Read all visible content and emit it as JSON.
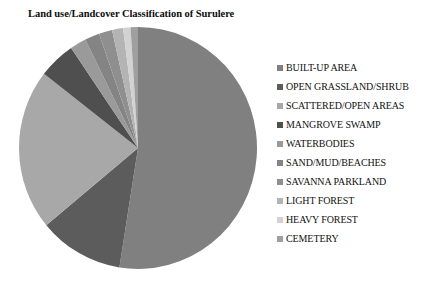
{
  "chart_data": {
    "type": "pie",
    "title": "Land use/Landcover Classification of Surulere",
    "xlabel": "",
    "ylabel": "",
    "legend_position": "right",
    "grid": false,
    "categories": [
      "BUILT-UP AREA",
      "OPEN GRASSLAND/SHRUB",
      "SCATTERED/OPEN AREAS",
      "MANGROVE SWAMP",
      "WATERBODIES",
      "SAND/MUD/BEACHES",
      "SAVANNA PARKLAND",
      "LIGHT FOREST",
      "HEAVY FOREST",
      "CEMETERY"
    ],
    "values": [
      52.5,
      11.5,
      21.5,
      5.0,
      2.2,
      2.0,
      1.8,
      1.5,
      1.0,
      1.0
    ],
    "colors": [
      "#808080",
      "#5c5c5c",
      "#a8a8a8",
      "#4f4f4f",
      "#9a9a9a",
      "#848484",
      "#8f8f8f",
      "#b4b4b4",
      "#d2d2d2",
      "#9f9f9f"
    ],
    "slices": [
      {
        "label": "BUILT-UP AREA",
        "value": 52.5,
        "color": "#808080",
        "start_angle": 0,
        "end_angle": 189.0
      },
      {
        "label": "OPEN GRASSLAND/SHRUB",
        "value": 11.5,
        "color": "#5c5c5c",
        "start_angle": 189.0,
        "end_angle": 230.4
      },
      {
        "label": "SCATTERED/OPEN AREAS",
        "value": 21.5,
        "color": "#a8a8a8",
        "start_angle": 230.4,
        "end_angle": 307.8
      },
      {
        "label": "MANGROVE SWAMP",
        "value": 5.0,
        "color": "#4f4f4f",
        "start_angle": 307.8,
        "end_angle": 325.8
      },
      {
        "label": "WATERBODIES",
        "value": 2.2,
        "color": "#9a9a9a",
        "start_angle": 325.8,
        "end_angle": 333.7
      },
      {
        "label": "SAND/MUD/BEACHES",
        "value": 2.0,
        "color": "#848484",
        "start_angle": 333.7,
        "end_angle": 340.9
      },
      {
        "label": "SAVANNA PARKLAND",
        "value": 1.8,
        "color": "#8f8f8f",
        "start_angle": 340.9,
        "end_angle": 347.4
      },
      {
        "label": "LIGHT FOREST",
        "value": 1.5,
        "color": "#b4b4b4",
        "start_angle": 347.4,
        "end_angle": 352.8
      },
      {
        "label": "HEAVY FOREST",
        "value": 1.0,
        "color": "#d2d2d2",
        "start_angle": 352.8,
        "end_angle": 356.4
      },
      {
        "label": "CEMETERY",
        "value": 1.0,
        "color": "#9f9f9f",
        "start_angle": 356.4,
        "end_angle": 360.0
      }
    ]
  },
  "legend": {
    "items": [
      {
        "label": "BUILT-UP AREA",
        "color": "#808080"
      },
      {
        "label": "OPEN GRASSLAND/SHRUB",
        "color": "#5c5c5c"
      },
      {
        "label": "SCATTERED/OPEN AREAS",
        "color": "#a8a8a8"
      },
      {
        "label": "MANGROVE SWAMP",
        "color": "#4f4f4f"
      },
      {
        "label": "WATERBODIES",
        "color": "#9a9a9a"
      },
      {
        "label": "SAND/MUD/BEACHES",
        "color": "#848484"
      },
      {
        "label": "SAVANNA PARKLAND",
        "color": "#8f8f8f"
      },
      {
        "label": "LIGHT FOREST",
        "color": "#b4b4b4"
      },
      {
        "label": "HEAVY FOREST",
        "color": "#d2d2d2"
      },
      {
        "label": "CEMETERY",
        "color": "#9f9f9f"
      }
    ]
  }
}
